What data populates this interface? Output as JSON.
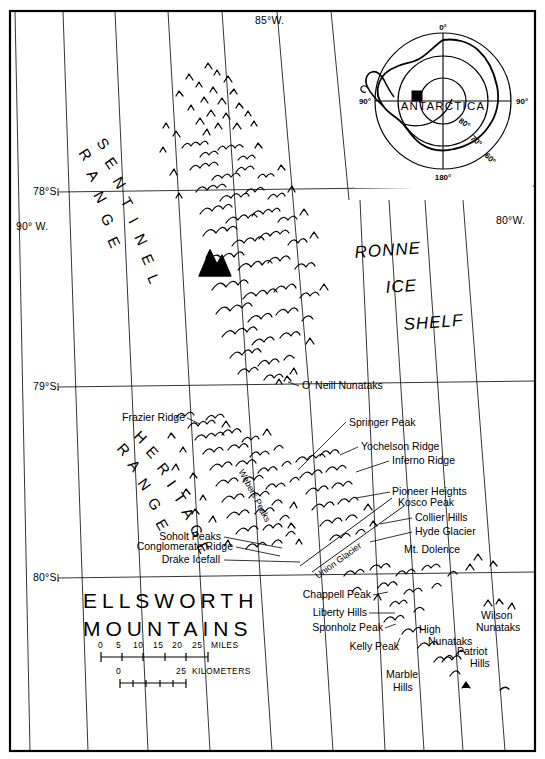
{
  "map": {
    "title_line1": "ELLSWORTH",
    "title_line2": "MOUNTAINS",
    "background_color": "#ffffff",
    "line_color": "#000000",
    "frame": {
      "x": 9,
      "y": 10,
      "width": 527,
      "height": 742
    }
  },
  "graticule": {
    "meridian_labels": [
      {
        "text": "85°W.",
        "x": 255,
        "y": 24
      },
      {
        "text": "90° W.",
        "x": 16,
        "y": 226
      },
      {
        "text": "80°W.",
        "x": 496,
        "y": 224
      }
    ],
    "parallel_labels": [
      {
        "text": "78°S.",
        "x": 33,
        "y": 195
      },
      {
        "text": "79°S.",
        "x": 33,
        "y": 389
      },
      {
        "text": "80°S.",
        "x": 33,
        "y": 581
      }
    ],
    "parallels": [
      {
        "label": "78°S.",
        "y_left": 192,
        "y_right": 187
      },
      {
        "label": "79°S.",
        "y_left": 387,
        "y_right": 382
      },
      {
        "label": "80°S.",
        "y_left": 578,
        "y_right": 573
      }
    ],
    "meridians_top_x": [
      15,
      63,
      115,
      168,
      222,
      277,
      331
    ],
    "meridians_bottom_x": [
      30,
      88,
      148,
      210,
      272,
      310,
      348,
      385,
      424,
      463
    ]
  },
  "ranges": [
    {
      "name": "SENTINEL RANGE",
      "line1": "SENTINEL",
      "line2": "RANGE"
    },
    {
      "name": "HERITAGE RANGE",
      "line1": "HERITAGE",
      "line2": "RANGE"
    }
  ],
  "ice_shelf": {
    "line1": "RONNE",
    "line2": "ICE",
    "line3": "SHELF"
  },
  "features": [
    {
      "name": "O' Neill Nunataks",
      "label": "O' Neill Nunataks",
      "x": 302,
      "y": 389,
      "anchor": "start"
    },
    {
      "name": "Frazier Ridge",
      "label": "Frazier Ridge",
      "x": 122,
      "y": 421,
      "anchor": "start"
    },
    {
      "name": "Springer Peak",
      "label": "Springer Peak",
      "x": 349,
      "y": 426,
      "anchor": "start"
    },
    {
      "name": "Yochelson Ridge",
      "label": "Yochelson Ridge",
      "x": 361,
      "y": 450,
      "anchor": "start"
    },
    {
      "name": "Inferno Ridge",
      "label": "Inferno Ridge",
      "x": 392,
      "y": 464,
      "anchor": "start"
    },
    {
      "name": "Webers Peaks",
      "label": "Webers Peaks",
      "x": 252,
      "y": 497,
      "anchor": "middle"
    },
    {
      "name": "Pioneer Heights",
      "label": "Pioneer Heights",
      "x": 392,
      "y": 495,
      "anchor": "start"
    },
    {
      "name": "Kosco Peak",
      "label": "Kosco Peak",
      "x": 398,
      "y": 506,
      "anchor": "start"
    },
    {
      "name": "Collier Hills",
      "label": "Collier Hills",
      "x": 415,
      "y": 521,
      "anchor": "start"
    },
    {
      "name": "Hyde Glacier",
      "label": "Hyde Glacier",
      "x": 415,
      "y": 535,
      "anchor": "start"
    },
    {
      "name": "Soholt Peaks",
      "label": "Soholt Peaks",
      "x": 221,
      "y": 540,
      "anchor": "end"
    },
    {
      "name": "Conglomerate Ridge",
      "label": "Conglomerate Ridge",
      "x": 233,
      "y": 550,
      "anchor": "end"
    },
    {
      "name": "Drake Icefall",
      "label": "Drake Icefall",
      "x": 220,
      "y": 563,
      "anchor": "end"
    },
    {
      "name": "Union Glacier",
      "label": "Union Glacier",
      "x": 340,
      "y": 563,
      "anchor": "middle"
    },
    {
      "name": "Mt. Dolence",
      "label": "Mt. Dolence",
      "x": 404,
      "y": 553,
      "anchor": "start"
    },
    {
      "name": "Chappell Peak",
      "label": "Chappell Peak",
      "x": 371,
      "y": 598,
      "anchor": "end"
    },
    {
      "name": "Liberty Hills",
      "label": "Liberty Hills",
      "x": 367,
      "y": 616,
      "anchor": "end"
    },
    {
      "name": "Sponholz Peak",
      "label": "Sponholz Peak",
      "x": 383,
      "y": 631,
      "anchor": "end"
    },
    {
      "name": "Kelly Peak",
      "label": "Kelly Peak",
      "x": 399,
      "y": 650,
      "anchor": "end"
    },
    {
      "name": "High",
      "label": "High",
      "x": 419,
      "y": 633,
      "anchor": "start"
    },
    {
      "name": "Nunataks",
      "label": "Nunataks",
      "x": 428,
      "y": 645,
      "anchor": "start"
    },
    {
      "name": "Wilson",
      "label": "Wilson",
      "x": 481,
      "y": 619,
      "anchor": "start"
    },
    {
      "name": "Wilson Nunataks",
      "label": "Nunataks",
      "x": 476,
      "y": 631,
      "anchor": "start"
    },
    {
      "name": "Patriot",
      "label": "Patriot",
      "x": 457,
      "y": 655,
      "anchor": "start"
    },
    {
      "name": "Patriot Hills",
      "label": "Hills",
      "x": 470,
      "y": 667,
      "anchor": "start"
    },
    {
      "name": "Marble",
      "label": "Marble",
      "x": 386,
      "y": 678,
      "anchor": "start"
    },
    {
      "name": "Marble Hills",
      "label": "Hills",
      "x": 393,
      "y": 691,
      "anchor": "start"
    }
  ],
  "scale_bars": [
    {
      "name": "miles-scale",
      "unit_label": "MILES",
      "ticks": [
        "0",
        "5",
        "10",
        "15",
        "20",
        "25"
      ],
      "tick_x": [
        101,
        119,
        138,
        158,
        178,
        198
      ],
      "label_x": 206,
      "bar_y": 656,
      "text_y": 648
    },
    {
      "name": "kilometers-scale",
      "unit_label": "KILOMETERS",
      "ticks": [
        "0",
        "25"
      ],
      "tick_x": [
        120,
        184
      ],
      "label_x": 190,
      "bar_y": 681,
      "text_y": 673
    }
  ],
  "inset": {
    "name": "antarctica-locator",
    "continent_label": "ANTARCTICA",
    "center": {
      "x": 443,
      "y": 101
    },
    "meridian_labels": [
      {
        "text": "0°",
        "x": 443,
        "y": 32
      },
      {
        "text": "90°",
        "x": 374,
        "y": 104
      },
      {
        "text": "90°",
        "x": 513,
        "y": 104
      },
      {
        "text": "180°",
        "x": 443,
        "y": 178
      }
    ],
    "parallel_labels": [
      {
        "text": "80°",
        "x": 462,
        "y": 125,
        "rotate": 35
      },
      {
        "text": "70°",
        "x": 474,
        "y": 140,
        "rotate": 40
      },
      {
        "text": "60°",
        "x": 489,
        "y": 155,
        "rotate": 45
      }
    ],
    "study_area_marker": {
      "x": 416,
      "y": 96,
      "size": 9
    }
  }
}
